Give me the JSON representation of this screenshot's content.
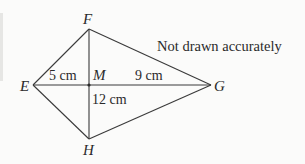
{
  "diagram": {
    "note": "Not drawn accurately",
    "vertices": {
      "E": {
        "label": "E",
        "x": 33,
        "y": 85
      },
      "F": {
        "label": "F",
        "x": 89,
        "y": 29
      },
      "G": {
        "label": "G",
        "x": 211,
        "y": 85
      },
      "H": {
        "label": "H",
        "x": 89,
        "y": 139
      },
      "M": {
        "label": "M",
        "x": 89,
        "y": 85
      }
    },
    "measurements": {
      "EM": "5 cm",
      "MG": "9 cm",
      "FH": "12 cm"
    },
    "colors": {
      "line": "#3a3a3a",
      "text": "#2a2a2a",
      "background": "#fbfbfa"
    }
  }
}
